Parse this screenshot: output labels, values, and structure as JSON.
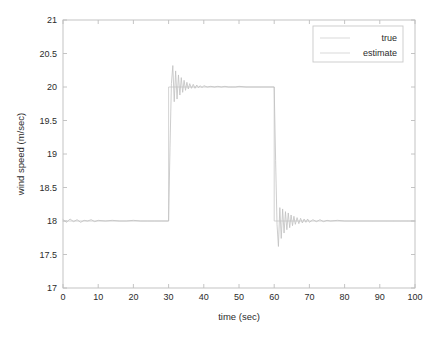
{
  "chart_data": {
    "type": "line",
    "title": "",
    "xlabel": "time (sec)",
    "ylabel": "wind speed (m/sec)",
    "xlim": [
      0,
      100
    ],
    "ylim": [
      17,
      21
    ],
    "xticks": [
      0,
      10,
      20,
      30,
      40,
      50,
      60,
      70,
      80,
      90,
      100
    ],
    "yticks": [
      17,
      17.5,
      18,
      18.5,
      19,
      19.5,
      20,
      20.5,
      21
    ],
    "xtick_labels": [
      "0",
      "10",
      "20",
      "30",
      "40",
      "50",
      "60",
      "70",
      "80",
      "90",
      "100"
    ],
    "ytick_labels": [
      "17",
      "17.5",
      "18",
      "18.5",
      "19",
      "19.5",
      "20",
      "20.5",
      "21"
    ],
    "grid": false,
    "legend_position": "top-right",
    "legend": [
      "true",
      "estimate"
    ],
    "series": [
      {
        "name": "true",
        "color": "#c8c8c8",
        "description": "Square wave reference: 18 m/sec from 0-30 s, 20 m/sec from 30-60 s, 18 m/sec from 60-100 s",
        "x": [
          0,
          30,
          30,
          60,
          60,
          100
        ],
        "values": [
          18,
          18,
          20,
          20,
          18,
          18
        ]
      },
      {
        "name": "estimate",
        "color": "#c0c0c0",
        "description": "Estimator output tracking the square wave with damped oscillatory transients at each step",
        "x": [
          0,
          1,
          2,
          3,
          4,
          5,
          6,
          7,
          8,
          9,
          10,
          12,
          14,
          16,
          18,
          20,
          22,
          24,
          26,
          28,
          29.5,
          30,
          30.4,
          30.8,
          31.2,
          31.6,
          32,
          32.4,
          32.8,
          33.2,
          33.6,
          34,
          34.4,
          34.8,
          35.2,
          35.6,
          36,
          36.5,
          37,
          37.5,
          38,
          38.5,
          39,
          39.5,
          40,
          41,
          42,
          43,
          44,
          45,
          46,
          47,
          48,
          49,
          50,
          52,
          54,
          56,
          58,
          59.5,
          60,
          60.4,
          60.8,
          61.2,
          61.6,
          62,
          62.4,
          62.8,
          63.2,
          63.6,
          64,
          64.4,
          64.8,
          65.2,
          65.6,
          66,
          66.5,
          67,
          67.5,
          68,
          68.5,
          69,
          69.5,
          70,
          71,
          72,
          73,
          74,
          75,
          76,
          78,
          80,
          82,
          84,
          86,
          88,
          90,
          92,
          94,
          96,
          98,
          100
        ],
        "values": [
          18.02,
          17.98,
          18.03,
          17.99,
          18.02,
          17.98,
          18.01,
          18.0,
          18.02,
          17.99,
          18.01,
          18.0,
          18.01,
          18.0,
          18.0,
          18.01,
          18.0,
          18.0,
          18.0,
          18.0,
          18.0,
          18.0,
          19.1,
          20.05,
          20.32,
          19.78,
          20.24,
          19.82,
          20.18,
          19.88,
          20.14,
          19.92,
          20.1,
          19.95,
          20.07,
          19.97,
          20.05,
          19.98,
          20.04,
          19.98,
          20.03,
          19.99,
          20.02,
          19.99,
          20.02,
          20.0,
          20.01,
          20.0,
          20.01,
          20.0,
          20.01,
          20.0,
          20.0,
          20.0,
          20.01,
          20.0,
          20.0,
          20.0,
          20.0,
          20.0,
          20.0,
          18.9,
          17.95,
          17.62,
          18.2,
          17.74,
          18.18,
          17.82,
          18.14,
          17.87,
          18.12,
          17.9,
          18.09,
          17.93,
          18.07,
          17.95,
          18.05,
          17.96,
          18.04,
          17.97,
          18.03,
          17.98,
          18.03,
          17.98,
          18.02,
          17.99,
          18.02,
          17.99,
          18.01,
          18.0,
          18.01,
          18.0,
          18.0,
          18.0,
          18.0,
          18.0,
          18.0,
          18.0,
          18.0,
          18.0,
          18.0,
          18.0
        ]
      }
    ]
  },
  "axes": {
    "xlabel": "time (sec)",
    "ylabel": "wind speed (m/sec)"
  },
  "legend": {
    "entries": [
      {
        "label": "true"
      },
      {
        "label": "estimate"
      }
    ]
  }
}
